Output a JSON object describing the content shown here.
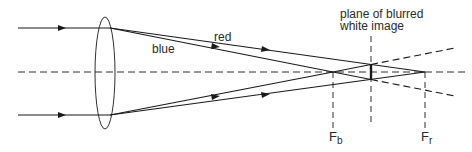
{
  "diagram": {
    "labels": {
      "red": "red",
      "blue": "blue",
      "plane_line1": "plane of blurred",
      "plane_line2": "white image",
      "fb_main": "F",
      "fb_sub": "b",
      "fr_main": "F",
      "fr_sub": "r"
    },
    "colors": {
      "line": "#1a1a1a",
      "text": "#2a2a2a",
      "background": "#ffffff"
    }
  }
}
